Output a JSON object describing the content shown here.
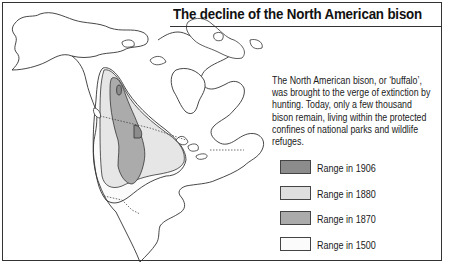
{
  "title": "The decline of the North American bison",
  "description": "The North American bison, or ‘buffalo’, was brought to the verge of extinction by hunting. Today, only a few thousand bison remain, living within the protected confines of national parks and wildlife refuges.",
  "legend": {
    "items": [
      {
        "label": "Range in 1906",
        "color": "#8c8c8c"
      },
      {
        "label": "Range in 1880",
        "color": "#dedede"
      },
      {
        "label": "Range in 1870",
        "color": "#ababab"
      },
      {
        "label": "Range in 1500",
        "color": "#fbfbfb"
      }
    ]
  },
  "map": {
    "region": "North America",
    "layers": [
      "range-1500",
      "range-1870",
      "range-1906",
      "coastline",
      "borders"
    ]
  }
}
